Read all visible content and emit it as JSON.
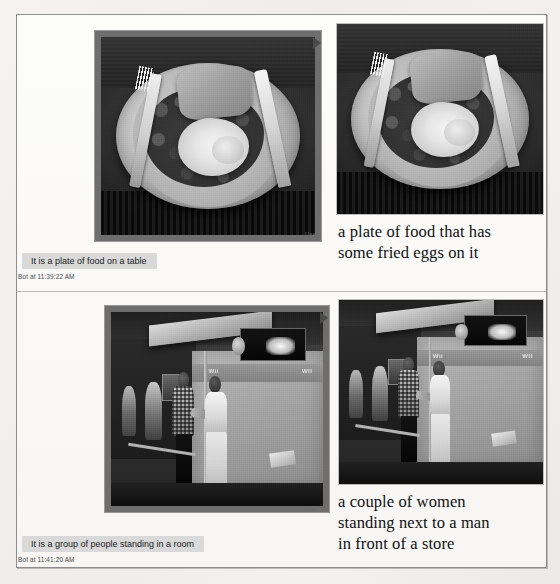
{
  "page": {
    "background_color": "#f1f0ee",
    "panel_background": "#fbfbfa",
    "panel_border_color": "#8e8e8e"
  },
  "conversations": [
    {
      "id": "row-1",
      "user_label": "User",
      "user_image_alt": "a plate of food with baked beans, a fried egg and toast, with a fork and knife",
      "bot_reply": "It is a plate of food on a table",
      "bot_timestamp": "Bot at 11:39:22 AM",
      "caption_lines": [
        "a plate of food that has",
        "some fried eggs on it"
      ],
      "caption_text": "a plate of food that has some fried eggs on it"
    },
    {
      "id": "row-2",
      "user_label": "User",
      "user_image_alt": "a man and a woman standing in front of a Wii booth at a store expo",
      "bot_reply": "It is a group of people standing in a room",
      "bot_timestamp": "Bot at 11:41:20 AM",
      "caption_lines": [
        "a couple of women",
        "standing next to a man",
        "in front of a store"
      ],
      "caption_text": "a couple of women standing next to a man in front of a store"
    }
  ],
  "scene_text": {
    "wii_left": "Wii",
    "wii_right": "WII"
  }
}
